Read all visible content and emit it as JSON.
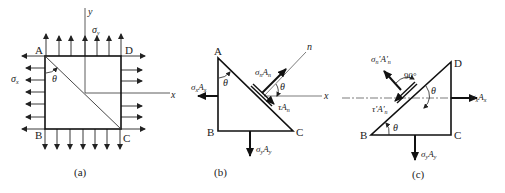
{
  "figure": {
    "panels": [
      {
        "id": "a",
        "caption": "(a)",
        "vertices": {
          "A": "A",
          "B": "B",
          "C": "C",
          "D": "D"
        },
        "axes": {
          "x": "x",
          "y": "y"
        },
        "stress_labels": {
          "sigma_x": "σ",
          "sigma_x_sub": "x",
          "sigma_y": "σ",
          "sigma_y_sub": "y"
        },
        "angle": "θ"
      },
      {
        "id": "b",
        "caption": "(b)",
        "vertices": {
          "A": "A",
          "B": "B",
          "C": "C"
        },
        "axes": {
          "x_left": "x",
          "x_right": "x",
          "n": "n"
        },
        "forces": {
          "left": {
            "main": "σ",
            "sub": "x",
            "area": "A",
            "area_sub": "x"
          },
          "normal": {
            "main": "σ",
            "sub": "n",
            "area": "A",
            "area_sub": "n"
          },
          "shear": {
            "main": "τ",
            "area": "A",
            "area_sub": "n"
          },
          "bottom": {
            "main": "σ",
            "sub": "y",
            "area": "A",
            "area_sub": "y"
          }
        },
        "angles": [
          "θ",
          "θ"
        ]
      },
      {
        "id": "c",
        "caption": "(c)",
        "vertices": {
          "B": "B",
          "C": "C",
          "D": "D"
        },
        "forces": {
          "normal": {
            "main": "σ",
            "sub": "n",
            "prime": "'",
            "area": "A",
            "area_prime": "'",
            "area_sub": "n"
          },
          "shear": {
            "main": "τ",
            "prime": "'",
            "area": "A",
            "area_prime": "'",
            "area_sub": "n"
          },
          "right": {
            "main": "σ",
            "sub": "x",
            "area": "A",
            "area_sub": "x"
          },
          "bottom": {
            "main": "σ",
            "sub": "y",
            "area": "A",
            "area_sub": "y"
          }
        },
        "right_angle": "90°",
        "angles": [
          "θ",
          "θ"
        ]
      }
    ]
  }
}
